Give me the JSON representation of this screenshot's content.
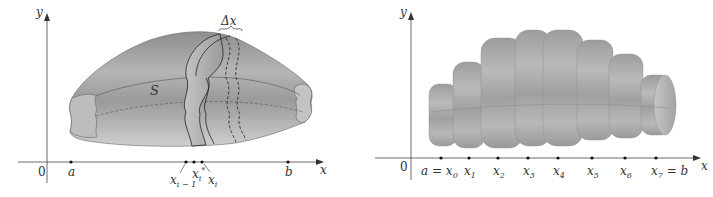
{
  "figure_left": {
    "title": "Solid S sliced into slabs of width Δx",
    "axis_x_label": "x",
    "axis_y_label": "y",
    "origin_label": "0",
    "solid_label": "S",
    "delta_label": "Δx",
    "point_a": "a",
    "point_b": "b",
    "point_xim1": {
      "base": "x",
      "sub": "i − 1"
    },
    "point_xistar": {
      "base": "x",
      "sub": "i",
      "sup": "*"
    },
    "point_xi": {
      "base": "x",
      "sub": "i"
    },
    "fill_color": "#a6a6a6",
    "shade_dark": "#7d7d7d",
    "shade_light": "#c8c8c8"
  },
  "figure_right": {
    "title": "Approximating solid by cylindrical slabs",
    "axis_x_label": "x",
    "axis_y_label": "y",
    "origin_label": "0",
    "ticks": [
      {
        "lhs": "a",
        "eq": " = ",
        "base": "x",
        "sub": "0",
        "rhs": ""
      },
      {
        "lhs": "",
        "eq": "",
        "base": "x",
        "sub": "1",
        "rhs": ""
      },
      {
        "lhs": "",
        "eq": "",
        "base": "x",
        "sub": "2",
        "rhs": ""
      },
      {
        "lhs": "",
        "eq": "",
        "base": "x",
        "sub": "3",
        "rhs": ""
      },
      {
        "lhs": "",
        "eq": "",
        "base": "x",
        "sub": "4",
        "rhs": ""
      },
      {
        "lhs": "",
        "eq": "",
        "base": "x",
        "sub": "5",
        "rhs": ""
      },
      {
        "lhs": "",
        "eq": "",
        "base": "x",
        "sub": "6",
        "rhs": ""
      },
      {
        "lhs": "",
        "eq": "",
        "base": "x",
        "sub": "7",
        "rhs": " = b"
      }
    ],
    "slab_count": 7,
    "fill_color": "#a9a9a9"
  }
}
